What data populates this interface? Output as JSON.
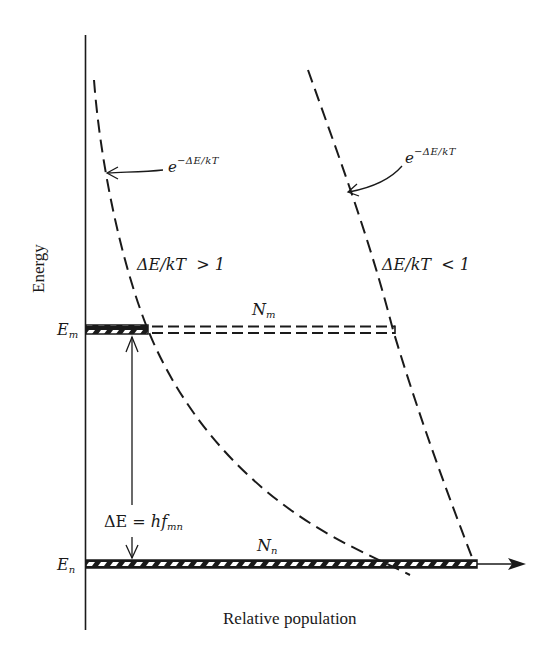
{
  "diagram": {
    "y_axis_label": "Energy",
    "x_axis_label": "Relative population",
    "levels": {
      "upper": {
        "label_base": "E",
        "label_sub": "m",
        "population_base": "N",
        "population_sub": "m"
      },
      "lower": {
        "label_base": "E",
        "label_sub": "n",
        "population_base": "N",
        "population_sub": "n"
      }
    },
    "gap_label": {
      "lhs": "ΔE",
      "eq": "=",
      "rhs_base": "hf",
      "rhs_sub": "mn"
    },
    "curves": [
      {
        "id": "steep",
        "exp_base": "e",
        "exp_sup": "−ΔE/kT",
        "condition": "ΔE/kT  > 1"
      },
      {
        "id": "shallow",
        "exp_base": "e",
        "exp_sup": "−ΔE/kT",
        "condition": "ΔE/kT  < 1"
      }
    ],
    "colors": {
      "ink": "#1a1a1a",
      "background": "#ffffff"
    }
  }
}
